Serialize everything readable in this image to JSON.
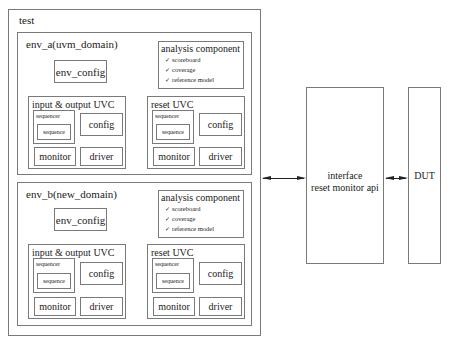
{
  "test": {
    "label": "test",
    "envs": [
      {
        "label": "env_a(uvm_domain)",
        "env_config": "env_config",
        "analysis": {
          "title": "analysis component",
          "items": [
            "scoreboard",
            "coverage",
            "reference model"
          ],
          "check_glyph": "✓"
        },
        "uvcs": [
          {
            "title": "input & output UVC",
            "sequencer": "sequencer",
            "sequence": "sequence",
            "config": "config",
            "monitor": "monitor",
            "driver": "driver"
          },
          {
            "title": "reset UVC",
            "sequencer": "sequencer",
            "sequence": "sequence",
            "config": "config",
            "monitor": "monitor",
            "driver": "driver"
          }
        ]
      },
      {
        "label": "env_b(new_domain)",
        "env_config": "env_config",
        "analysis": {
          "title": "analysis component",
          "items": [
            "scoreboard",
            "coverage",
            "reference model"
          ],
          "check_glyph": "✓"
        },
        "uvcs": [
          {
            "title": "input & output UVC",
            "sequencer": "sequencer",
            "sequence": "sequence",
            "config": "config",
            "monitor": "monitor",
            "driver": "driver"
          },
          {
            "title": "reset UVC",
            "sequencer": "sequencer",
            "sequence": "sequence",
            "config": "config",
            "monitor": "monitor",
            "driver": "driver"
          }
        ]
      }
    ]
  },
  "interface": {
    "line1": "interface",
    "line2": "reset monitor api"
  },
  "dut": {
    "label": "DUT"
  },
  "colors": {
    "border": "#7a7a7a",
    "text": "#222222",
    "arrow": "#222222"
  }
}
